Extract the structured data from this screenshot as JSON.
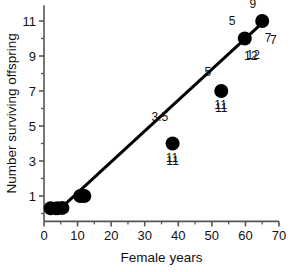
{
  "chart_data": {
    "type": "scatter",
    "title": "",
    "xlabel": "Female years",
    "ylabel": "Number surviving offspring",
    "xlim": [
      0,
      70
    ],
    "ylim": [
      -0.45,
      11.9
    ],
    "grid": false,
    "legend": null,
    "x_ticks": [
      "0",
      "10",
      "20",
      "30",
      "40",
      "50",
      "60",
      "70"
    ],
    "x_tick_values": [
      0,
      10,
      20,
      30,
      40,
      50,
      60,
      70
    ],
    "x_minor_step": 5,
    "y_ticks": [
      "1",
      "3",
      "5",
      "7",
      "9",
      "11"
    ],
    "y_tick_values": [
      1,
      3,
      5,
      7,
      9,
      11
    ],
    "y_minor_step": 1,
    "points": [
      {
        "x": 2.0,
        "y": 0.3,
        "label": "",
        "label_pos": "none"
      },
      {
        "x": 4.0,
        "y": 0.3,
        "label": "",
        "label_pos": "none"
      },
      {
        "x": 5.5,
        "y": 0.32,
        "label": "",
        "label_pos": "none"
      },
      {
        "x": 10.8,
        "y": 1.0,
        "label": "",
        "label_pos": "none"
      },
      {
        "x": 12.0,
        "y": 1.0,
        "label": "",
        "label_pos": "none"
      },
      {
        "x": 38.3,
        "y": 4.0,
        "label": "11",
        "label_pos": "below"
      },
      {
        "x": 52.8,
        "y": 7.0,
        "label": "11",
        "label_pos": "below"
      },
      {
        "x": 59.8,
        "y": 10.0,
        "label": "12",
        "label_pos": "below-right"
      },
      {
        "x": 65.0,
        "y": 11.0,
        "label": "7",
        "label_pos": "below-right"
      }
    ],
    "annotations": [
      {
        "text": "9",
        "x": 62.2,
        "y": 11.75
      },
      {
        "text": "5",
        "x": 56.0,
        "y": 10.75
      },
      {
        "text": "7",
        "x": 68.3,
        "y": 9.7
      },
      {
        "text": "12",
        "x": 62.3,
        "y": 8.85
      },
      {
        "text": "5",
        "x": 48.8,
        "y": 7.85
      },
      {
        "text": "11",
        "x": 52.6,
        "y": 5.95
      },
      {
        "text": "3.5",
        "x": 34.5,
        "y": 5.3
      },
      {
        "text": "11",
        "x": 38.1,
        "y": 2.95
      }
    ],
    "fit_line": {
      "type": "linear",
      "x_start": 3.0,
      "y_start": -0.05,
      "x_end": 66.5,
      "y_end": 11.15,
      "slope": 0.1764,
      "intercept": -0.58
    },
    "marker": {
      "shape": "circle",
      "color": "#000000",
      "radius_px": 7
    },
    "style": {
      "line_color": "#000000",
      "line_width_px": 3,
      "axis_color": "#555555",
      "background": "#ffffff"
    }
  }
}
